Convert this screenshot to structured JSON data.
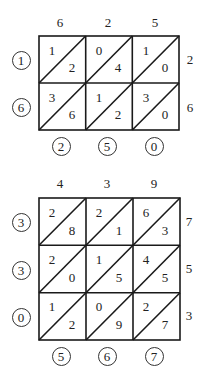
{
  "diagrams": [
    {
      "name": "lattice-625-x-26",
      "top_digits": [
        "6",
        "2",
        "5"
      ],
      "right_digits": [
        "2",
        "6"
      ],
      "left_circled": [
        "1",
        "6"
      ],
      "bottom_circled": [
        "2",
        "5",
        "0"
      ],
      "cells": [
        [
          {
            "tens": "1",
            "ones": "2"
          },
          {
            "tens": "0",
            "ones": "4"
          },
          {
            "tens": "1",
            "ones": "0"
          }
        ],
        [
          {
            "tens": "3",
            "ones": "6"
          },
          {
            "tens": "1",
            "ones": "2"
          },
          {
            "tens": "3",
            "ones": "0"
          }
        ]
      ],
      "result": "16250"
    },
    {
      "name": "lattice-439-x-753",
      "top_digits": [
        "4",
        "3",
        "9"
      ],
      "right_digits": [
        "7",
        "5",
        "3"
      ],
      "left_circled": [
        "3",
        "3",
        "0"
      ],
      "bottom_circled": [
        "5",
        "6",
        "7"
      ],
      "cells": [
        [
          {
            "tens": "2",
            "ones": "8"
          },
          {
            "tens": "2",
            "ones": "1"
          },
          {
            "tens": "6",
            "ones": "3"
          }
        ],
        [
          {
            "tens": "2",
            "ones": "0"
          },
          {
            "tens": "1",
            "ones": "5"
          },
          {
            "tens": "4",
            "ones": "5"
          }
        ],
        [
          {
            "tens": "1",
            "ones": "2"
          },
          {
            "tens": "0",
            "ones": "9"
          },
          {
            "tens": "2",
            "ones": "7"
          }
        ]
      ],
      "result": "330567"
    }
  ],
  "colors": {
    "line": "#1a1a1a",
    "text": "#222222",
    "background": "#ffffff"
  }
}
